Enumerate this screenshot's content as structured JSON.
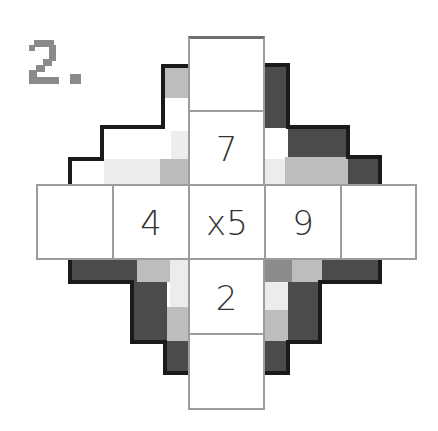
{
  "puzzle": {
    "number_label": "2.",
    "center": "x5",
    "cells": {
      "top_outer": "",
      "top_inner": "7",
      "left_outer": "",
      "left_inner": "4",
      "right_inner": "9",
      "right_outer": "",
      "bottom_inner": "2",
      "bottom_outer": ""
    }
  },
  "colors": {
    "cell_border": "#9c9c9c",
    "digit": "#333333",
    "title": "#8a8a8a",
    "dark": "#4a4a4a",
    "medium": "#8c8c8c",
    "light": "#bdbdbd",
    "very_light": "#ececec",
    "outline": "#1a1a1a"
  }
}
